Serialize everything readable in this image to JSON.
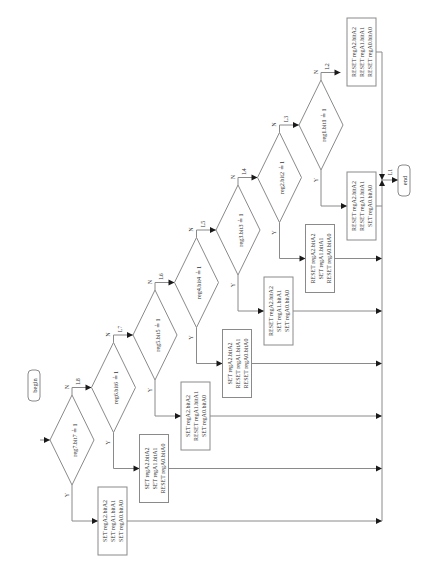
{
  "start": {
    "label": "begin"
  },
  "terminal": {
    "label": "end"
  },
  "branch_labels": {
    "yes": "Y",
    "no": "N"
  },
  "decisions": [
    {
      "condition": "reg7.bit7 ≟ 1",
      "next_label": "L8",
      "actions": [
        "SET regA2.bitA2",
        "SET regA1.bitA1",
        "SET regA0.bitA0"
      ]
    },
    {
      "condition": "reg6.bit6 ≟ 1",
      "next_label": "L7",
      "actions": [
        "SET regA2.bitA2",
        "SET regA1.bitA1",
        "RESET regA0.bitA0"
      ]
    },
    {
      "condition": "reg5.bit5 ≟ 1",
      "next_label": "L6",
      "actions": [
        "SET regA2.bitA2",
        "RESET regA1.bitA1",
        "SET regA0.bitA0"
      ]
    },
    {
      "condition": "reg4.bit4 ≟ 1",
      "next_label": "L5",
      "actions": [
        "SET regA2.bitA2",
        "RESET regA1.bitA1",
        "RESET regA0.bitA0"
      ]
    },
    {
      "condition": "reg3.bit3 ≟ 1",
      "next_label": "L4",
      "actions": [
        "RESET regA2.bitA2",
        "SET regA1.bitA1",
        "SET regA0.bitA0"
      ]
    },
    {
      "condition": "reg2.bit2 ≟ 1",
      "next_label": "L3",
      "actions": [
        "RESET regA2.bitA2",
        "SET regA1.bitA1",
        "RESET regA0.bitA0"
      ]
    },
    {
      "condition": "reg1.bit1 ≟ 1",
      "next_label": "L2",
      "actions": [
        "RESET regA2.bitA2",
        "RESET regA1.bitA1",
        "SET regA0.bitA0"
      ]
    }
  ],
  "default_actions": [
    "RESET regA2.bitA2",
    "RESET regA1.bitA1",
    "RESET regA0.bitA0"
  ],
  "merge_label": "L1"
}
